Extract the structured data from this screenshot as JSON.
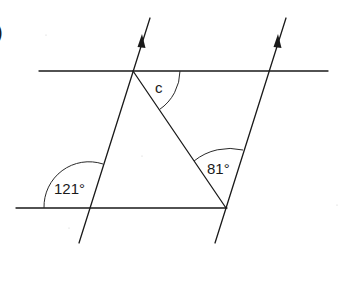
{
  "figure": {
    "part_marker": ")",
    "labels": {
      "unknown_angle": "c",
      "angle_right_vertex": "81°",
      "angle_left_exterior": "121°"
    },
    "colors": {
      "line": "#1a1a1a",
      "background": "#ffffff"
    }
  }
}
